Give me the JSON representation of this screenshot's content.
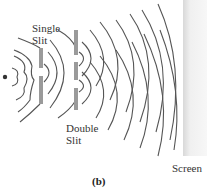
{
  "figure": {
    "labels": {
      "single_slit": [
        "Single",
        "Slit"
      ],
      "double_slit": [
        "Double",
        "Slit"
      ],
      "screen": "Screen"
    },
    "caption": "(b)",
    "colors": {
      "wave": "#555555",
      "barrier": "#9a9a9a",
      "screen": "#ececec",
      "source": "#333333"
    }
  }
}
